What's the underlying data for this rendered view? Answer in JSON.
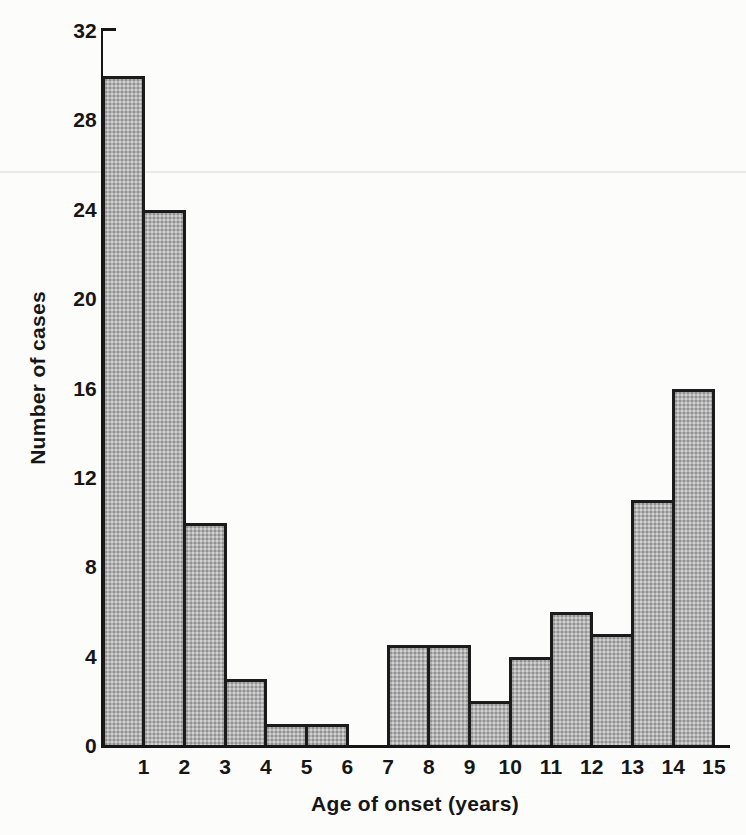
{
  "figure": {
    "paper_color": "#fcfcfb",
    "ink_color": "#161616",
    "bar_fill_color": "#b2b2b2",
    "bar_border_color": "#1b1b1b"
  },
  "chart_data": {
    "type": "bar",
    "title": "",
    "xlabel": "Age of onset (years)",
    "ylabel": "Number of cases",
    "x_tick_labels": [
      "1",
      "2",
      "3",
      "4",
      "5",
      "6",
      "7",
      "8",
      "9",
      "10",
      "11",
      "12",
      "13",
      "14",
      "15"
    ],
    "y_ticks": [
      0,
      4,
      8,
      12,
      16,
      20,
      24,
      28,
      32
    ],
    "ylim": [
      0,
      32
    ],
    "xlim": [
      0,
      15
    ],
    "bin_edges": [
      0,
      1,
      2,
      3,
      4,
      5,
      6,
      7,
      8,
      9,
      10,
      11,
      12,
      13,
      14,
      15
    ],
    "values": [
      30,
      24,
      10,
      3,
      1,
      1,
      0,
      4.5,
      4.5,
      2,
      4,
      6,
      5,
      11,
      16
    ],
    "grid": "off",
    "legend": "none"
  }
}
